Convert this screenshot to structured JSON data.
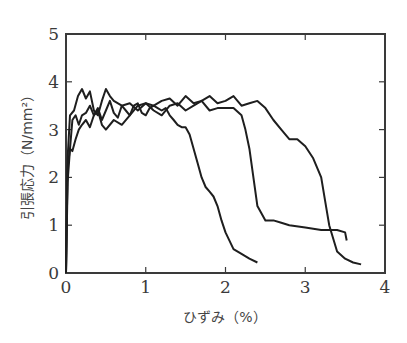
{
  "chart_data": {
    "type": "line",
    "title": "",
    "xlabel": "ひずみ（%）",
    "ylabel": "引張応力（N/mm²）",
    "xlim": [
      0,
      4
    ],
    "ylim": [
      0,
      5
    ],
    "xticks": [
      "0",
      "1",
      "2",
      "3",
      "4"
    ],
    "yticks": [
      "0",
      "1",
      "2",
      "3",
      "4",
      "5"
    ],
    "grid": false,
    "legend": null,
    "series": [
      {
        "name": "specimen-1",
        "x": [
          0,
          0.02,
          0.05,
          0.08,
          0.12,
          0.16,
          0.2,
          0.25,
          0.3,
          0.35,
          0.4,
          0.45,
          0.5,
          0.55,
          0.6,
          0.65,
          0.7,
          0.75,
          0.8,
          0.85,
          0.9,
          0.95,
          1.0,
          1.05,
          1.1,
          1.15,
          1.2,
          1.25,
          1.3,
          1.35,
          1.4,
          1.45,
          1.5,
          1.55,
          1.6,
          1.65,
          1.7,
          1.75,
          1.8,
          1.85,
          1.9,
          1.95,
          2.0,
          2.1,
          2.2,
          2.3,
          2.4
        ],
        "y": [
          0,
          1.9,
          2.6,
          2.55,
          2.8,
          3.0,
          3.1,
          3.2,
          3.05,
          3.3,
          3.45,
          3.2,
          3.4,
          3.6,
          3.35,
          3.25,
          3.5,
          3.4,
          3.3,
          3.5,
          3.55,
          3.35,
          3.3,
          3.45,
          3.5,
          3.45,
          3.4,
          3.45,
          3.3,
          3.2,
          3.1,
          3.05,
          3.05,
          2.9,
          2.6,
          2.3,
          2.0,
          1.8,
          1.7,
          1.6,
          1.4,
          1.1,
          0.85,
          0.5,
          0.4,
          0.3,
          0.22
        ]
      },
      {
        "name": "specimen-2",
        "x": [
          0,
          0.02,
          0.05,
          0.08,
          0.12,
          0.16,
          0.2,
          0.25,
          0.3,
          0.35,
          0.4,
          0.45,
          0.5,
          0.6,
          0.7,
          0.8,
          0.9,
          1.0,
          1.1,
          1.2,
          1.3,
          1.4,
          1.5,
          1.6,
          1.7,
          1.8,
          1.9,
          2.0,
          2.1,
          2.2,
          2.25,
          2.3,
          2.35,
          2.4,
          2.5,
          2.6,
          2.7,
          2.8,
          3.0,
          3.2,
          3.4,
          3.5,
          3.52
        ],
        "y": [
          0,
          2.2,
          2.6,
          3.2,
          3.3,
          3.1,
          3.3,
          3.35,
          3.5,
          3.3,
          3.4,
          3.1,
          3.0,
          3.2,
          3.1,
          3.3,
          3.5,
          3.55,
          3.4,
          3.3,
          3.5,
          3.55,
          3.4,
          3.5,
          3.6,
          3.4,
          3.45,
          3.45,
          3.45,
          3.3,
          3.0,
          2.6,
          2.0,
          1.4,
          1.1,
          1.1,
          1.05,
          1.0,
          0.95,
          0.9,
          0.9,
          0.85,
          0.68
        ]
      },
      {
        "name": "specimen-3",
        "x": [
          0,
          0.02,
          0.05,
          0.1,
          0.15,
          0.2,
          0.25,
          0.3,
          0.35,
          0.4,
          0.45,
          0.5,
          0.55,
          0.6,
          0.7,
          0.8,
          0.9,
          1.0,
          1.1,
          1.2,
          1.3,
          1.4,
          1.5,
          1.6,
          1.7,
          1.8,
          1.9,
          2.0,
          2.1,
          2.2,
          2.3,
          2.4,
          2.5,
          2.6,
          2.7,
          2.8,
          2.9,
          3.0,
          3.1,
          3.2,
          3.25,
          3.3,
          3.4,
          3.5,
          3.6,
          3.7
        ],
        "y": [
          0,
          2.4,
          3.3,
          3.4,
          3.7,
          3.85,
          3.65,
          3.8,
          3.4,
          3.3,
          3.6,
          3.85,
          3.7,
          3.6,
          3.5,
          3.55,
          3.4,
          3.55,
          3.5,
          3.6,
          3.65,
          3.5,
          3.7,
          3.55,
          3.6,
          3.7,
          3.55,
          3.6,
          3.7,
          3.5,
          3.55,
          3.6,
          3.45,
          3.2,
          3.0,
          2.8,
          2.8,
          2.65,
          2.4,
          2.0,
          1.5,
          1.0,
          0.45,
          0.3,
          0.22,
          0.18
        ]
      }
    ]
  }
}
